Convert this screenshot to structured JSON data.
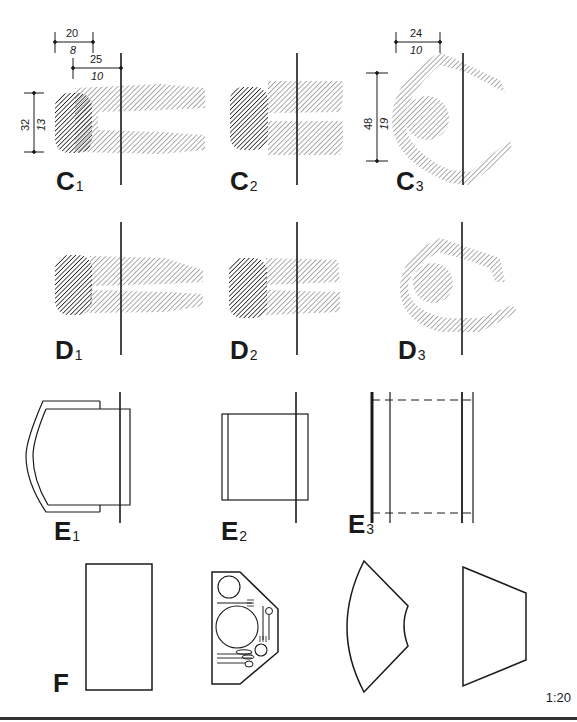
{
  "figure": {
    "type": "technical-drawing",
    "scale_label": "1:20",
    "ink_color": "#1a1a1a",
    "hatch_dark_color": "#222222",
    "hatch_light_color": "#555555"
  },
  "rows": {
    "C": {
      "panels": [
        {
          "letter": "C",
          "index": "1"
        },
        {
          "letter": "C",
          "index": "2"
        },
        {
          "letter": "C",
          "index": "3"
        }
      ]
    },
    "D": {
      "panels": [
        {
          "letter": "D",
          "index": "1"
        },
        {
          "letter": "D",
          "index": "2"
        },
        {
          "letter": "D",
          "index": "3"
        }
      ]
    },
    "E": {
      "panels": [
        {
          "letter": "E",
          "index": "1"
        },
        {
          "letter": "E",
          "index": "2"
        },
        {
          "letter": "E",
          "index": "3"
        }
      ]
    },
    "F": {
      "label": "F",
      "shapes": [
        "rectangle",
        "hexagonal-table-with-place-setting",
        "annular-sector",
        "trapezoid"
      ]
    }
  },
  "dimensions": {
    "c1_top_width": {
      "cm": "20",
      "in": "8"
    },
    "c1_reach": {
      "cm": "25",
      "in": "10"
    },
    "c1_height": {
      "cm": "32",
      "in": "13"
    },
    "c3_top_width": {
      "cm": "24",
      "in": "10"
    },
    "c3_height": {
      "cm": "48",
      "in": "19"
    }
  }
}
